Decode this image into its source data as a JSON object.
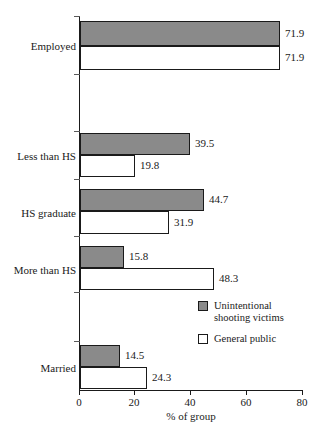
{
  "chart_data": {
    "type": "bar",
    "orientation": "horizontal",
    "title": "",
    "xlabel": "% of group",
    "ylabel": "",
    "xlim": [
      0,
      80
    ],
    "xticks": [
      0,
      20,
      40,
      60,
      80
    ],
    "xtick_labels": [
      "0",
      "20",
      "40",
      "60",
      "80"
    ],
    "grid": false,
    "legend_position": "inside-right-middle",
    "categories": [
      "Employed",
      "Less than HS",
      "HS graduate",
      "More than HS",
      "Married"
    ],
    "series": [
      {
        "name": "Unintentional shooting victims",
        "color": "#8a8a8a",
        "values": [
          71.9,
          39.5,
          44.7,
          15.8,
          14.5
        ]
      },
      {
        "name": "General public",
        "color": "#ffffff",
        "values": [
          71.9,
          19.8,
          31.9,
          48.3,
          24.3
        ]
      }
    ],
    "value_labels": [
      [
        "71.9",
        "39.5",
        "44.7",
        "15.8",
        "14.5"
      ],
      [
        "71.9",
        "19.8",
        "31.9",
        "48.3",
        "24.3"
      ]
    ]
  },
  "legend": {
    "entries": [
      {
        "label": "Unintentional\nshooting victims",
        "swatch": "gray-filled-square"
      },
      {
        "label": "General public",
        "swatch": "white-outlined-square"
      }
    ]
  },
  "axis": {
    "x_label": "% of group",
    "x_tick_labels": [
      "0",
      "20",
      "40",
      "60",
      "80"
    ],
    "y_tick_labels": [
      "Employed",
      "Less than HS",
      "HS graduate",
      "More than HS",
      "Married"
    ]
  }
}
